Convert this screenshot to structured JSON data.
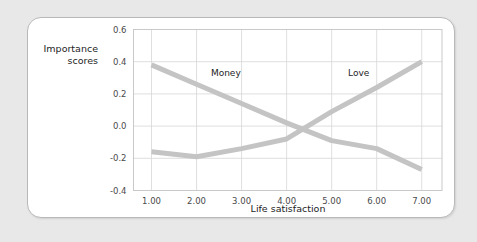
{
  "card": {
    "background_color": "#ffffff",
    "border_color": "#b9b9b9",
    "page_background_color": "#e8e8e8"
  },
  "chart_data": {
    "type": "line",
    "title": "",
    "xlabel": "Life satisfaction",
    "ylabel": "Importance scores",
    "ylabel_line1": "Importance",
    "ylabel_line2": "scores",
    "x": [
      1,
      2,
      3,
      4,
      5,
      6,
      7
    ],
    "xtick_labels": [
      "1.00",
      "2.00",
      "3.00",
      "4.00",
      "5.00",
      "6.00",
      "7.00"
    ],
    "ytick_labels": [
      "0.6",
      "0.4",
      "0.2",
      "0.0",
      "-0.2",
      "-0.4"
    ],
    "yticks": [
      0.6,
      0.4,
      0.2,
      0.0,
      -0.2,
      -0.4
    ],
    "xlim": [
      0.6,
      7.45
    ],
    "ylim": [
      -0.4,
      0.6
    ],
    "grid": true,
    "legend_position": "inline-labels",
    "line_color": "#c4c4c4",
    "series": [
      {
        "name": "Money",
        "label": "Money",
        "label_x": 2.65,
        "label_y": 0.31,
        "color": "#c4c4c4",
        "values": [
          0.38,
          0.26,
          0.14,
          0.02,
          -0.09,
          -0.14,
          -0.27
        ]
      },
      {
        "name": "Love",
        "label": "Love",
        "label_x": 5.6,
        "label_y": 0.31,
        "color": "#c4c4c4",
        "values": [
          -0.16,
          -0.19,
          -0.14,
          -0.08,
          0.09,
          0.24,
          0.4
        ]
      }
    ]
  }
}
